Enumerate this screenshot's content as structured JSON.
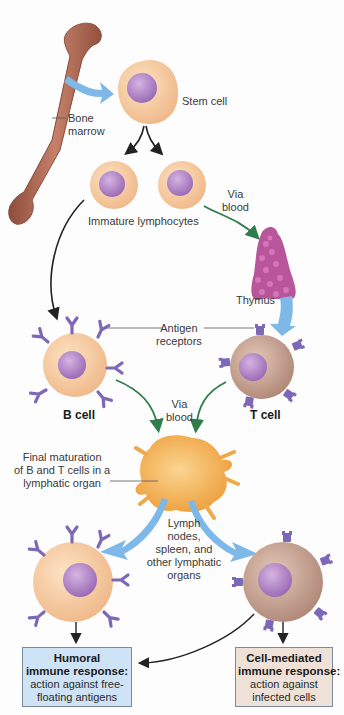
{
  "colors": {
    "cell_fill": "#f6cfa4",
    "nucleus": "#b487c7",
    "t_cell_fill": "#c9a695",
    "receptor": "#7d68b8",
    "bone": "#a9644f",
    "thymus": "#b9559b",
    "lymph_organ": "#f4b55a",
    "blue_arrow": "#7db8e8",
    "green_arrow": "#2f7d4a",
    "humoral_box": "#cfe3f6",
    "cell_mediated_box": "#eee2d8"
  },
  "labels": {
    "bone_marrow": "Bone\nmarrow",
    "stem_cell": "Stem cell",
    "immature_lymphocytes": "Immature lymphocytes",
    "via_blood_1": "Via\nblood",
    "thymus": "Thymus",
    "antigen_receptors": "Antigen\nreceptors",
    "b_cell": "B cell",
    "t_cell": "T cell",
    "via_blood_2": "Via\nblood",
    "final_maturation": "Final maturation\nof B and T cells in a\nlymphatic organ",
    "lymph_nodes": "Lymph\nnodes,\nspleen, and\nother lymphatic\norgans"
  },
  "boxes": {
    "humoral": {
      "title": "Humoral\nimmune response:",
      "desc": "action against free-\nfloating antigens"
    },
    "cell_mediated": {
      "title": "Cell-mediated\nimmune response:",
      "desc": "action against\ninfected cells"
    }
  }
}
